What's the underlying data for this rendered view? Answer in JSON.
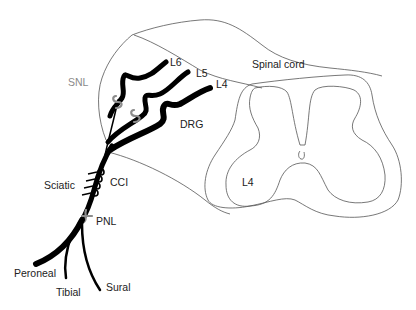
{
  "diagram": {
    "labels": {
      "spinal_cord": "Spinal cord",
      "snl": "SNL",
      "l6": "L6",
      "l5": "L5",
      "l4_root": "L4",
      "drg": "DRG",
      "l4_section": "L4",
      "sciatic": "Sciatic",
      "cci": "CCI",
      "pnl": "PNL",
      "peroneal": "Peroneal",
      "tibial": "Tibial",
      "sural": "Sural"
    },
    "colors": {
      "nerve": "#000000",
      "ligature": "#8c8c8c",
      "outline": "#555555",
      "label": "#222222",
      "label_muted": "#8a8a8a"
    }
  }
}
